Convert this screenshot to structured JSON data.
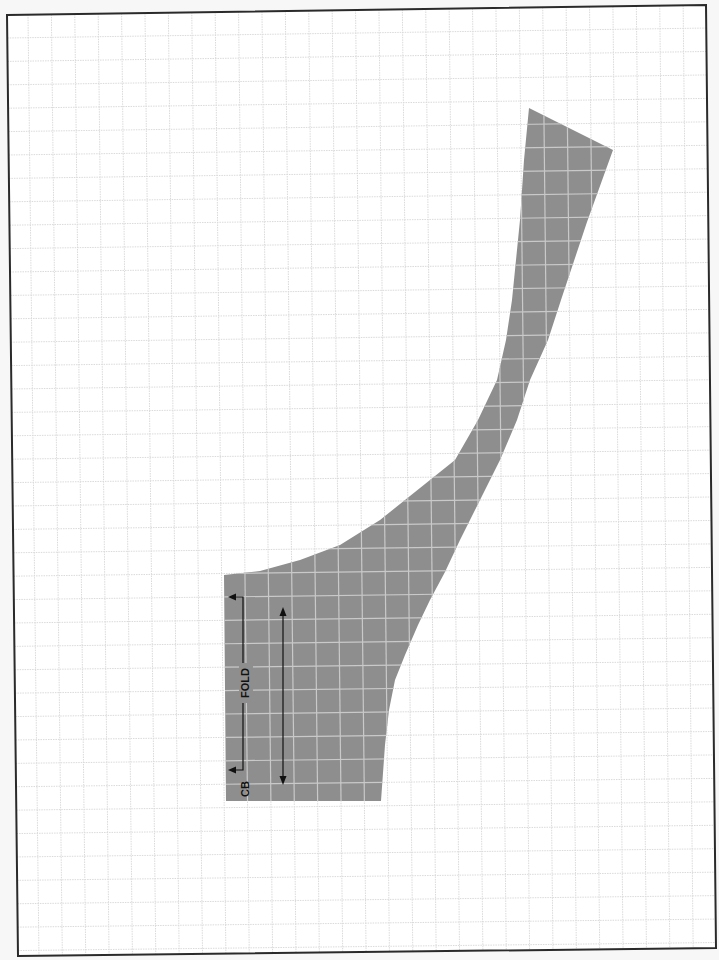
{
  "page": {
    "background": "#f7f7f7",
    "paper_color": "#ffffff",
    "border_color": "#2a2a2a",
    "corners": {
      "top_left": [
        7,
        15
      ],
      "top_right": [
        706,
        5
      ],
      "bottom_right": [
        716,
        948
      ],
      "bottom_left": [
        18,
        956
      ]
    }
  },
  "grid": {
    "color": "#dadada",
    "spacing_px": 23.4,
    "style": "dotted"
  },
  "pattern_piece": {
    "name": "back neck facing",
    "fill_color": "#8e8e8e",
    "grid_overlay_color": "#c9c9c9",
    "outline_points": [
      [
        529,
        108
      ],
      [
        613,
        150
      ],
      [
        587,
        222
      ],
      [
        561,
        300
      ],
      [
        548,
        340
      ],
      [
        530,
        380
      ],
      [
        517,
        420
      ],
      [
        500,
        460
      ],
      [
        480,
        500
      ],
      [
        460,
        540
      ],
      [
        445,
        572
      ],
      [
        430,
        600
      ],
      [
        418,
        625
      ],
      [
        405,
        655
      ],
      [
        395,
        680
      ],
      [
        389,
        710
      ],
      [
        385,
        745
      ],
      [
        381,
        801
      ],
      [
        226,
        801
      ],
      [
        224,
        575
      ],
      [
        260,
        571
      ],
      [
        300,
        560
      ],
      [
        340,
        545
      ],
      [
        380,
        520
      ],
      [
        420,
        488
      ],
      [
        455,
        460
      ],
      [
        478,
        420
      ],
      [
        497,
        380
      ],
      [
        506,
        340
      ],
      [
        512,
        300
      ],
      [
        520,
        220
      ],
      [
        524,
        160
      ]
    ]
  },
  "markings": {
    "fold_label": "FOLD",
    "cb_label": "CB",
    "fold_bracket": {
      "x_edge": 228,
      "x_line": 243,
      "y_top": 597,
      "y_bottom": 770
    },
    "grainline": {
      "x": 283,
      "y_top": 607,
      "y_bottom": 785
    },
    "fold_label_pos": [
      246,
      683
    ],
    "cb_label_pos": [
      246,
      789
    ]
  }
}
